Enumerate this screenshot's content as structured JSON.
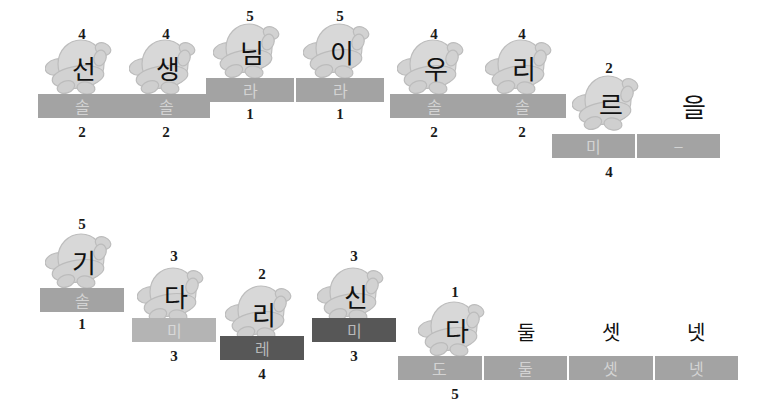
{
  "worksheet": {
    "title": "Korean music rhythm worksheet",
    "background_color": "#ffffff",
    "palette": {
      "bar_mid": "#a3a3a3",
      "bar_light": "#b4b4b4",
      "bar_dark": "#575757",
      "bar_text": "#d3d3d3",
      "number_text": "#1a1a1a",
      "syllable_text": "#111111",
      "mascot_fill": "#d6d6d6",
      "mascot_stroke": "#bdbdbd"
    }
  },
  "rows": [
    {
      "row_index": 1,
      "groups": [
        {
          "id": "g1",
          "top_number": "4",
          "syllable": "선",
          "has_mascot": true,
          "bottom_number": "2",
          "bar": {
            "shade": "mid",
            "segments": [
              "솔"
            ]
          },
          "x": 38,
          "mascot_y": 36,
          "bar_y": 94,
          "top_num_y": 26,
          "bottom_num_y": 124,
          "bar_w": 88
        },
        {
          "id": "g2",
          "top_number": "4",
          "syllable": "생",
          "has_mascot": true,
          "bottom_number": "2",
          "bar": {
            "shade": "mid",
            "segments": [
              "솔"
            ]
          },
          "x": 122,
          "mascot_y": 36,
          "bar_y": 94,
          "top_num_y": 26,
          "bottom_num_y": 124,
          "bar_w": 88
        },
        {
          "id": "g3",
          "top_number": "5",
          "syllable": "님",
          "has_mascot": true,
          "bottom_number": "1",
          "bar": {
            "shade": "mid",
            "segments": [
              "라"
            ]
          },
          "x": 206,
          "mascot_y": 20,
          "bar_y": 78,
          "top_num_y": 8,
          "bottom_num_y": 106,
          "bar_w": 88
        },
        {
          "id": "g4",
          "top_number": "5",
          "syllable": "이",
          "has_mascot": true,
          "bottom_number": "1",
          "bar": {
            "shade": "mid",
            "segments": [
              "라"
            ]
          },
          "x": 296,
          "mascot_y": 20,
          "bar_y": 78,
          "top_num_y": 8,
          "bottom_num_y": 106,
          "bar_w": 88
        },
        {
          "id": "g5",
          "top_number": "4",
          "syllable": "우",
          "has_mascot": true,
          "bottom_number": "2",
          "bar": {
            "shade": "mid",
            "segments": [
              "솔"
            ]
          },
          "x": 390,
          "mascot_y": 36,
          "bar_y": 94,
          "top_num_y": 26,
          "bottom_num_y": 124,
          "bar_w": 88
        },
        {
          "id": "g6",
          "top_number": "4",
          "syllable": "리",
          "has_mascot": true,
          "bottom_number": "2",
          "bar": {
            "shade": "mid",
            "segments": [
              "솔"
            ]
          },
          "x": 478,
          "mascot_y": 36,
          "bar_y": 94,
          "top_num_y": 26,
          "bottom_num_y": 124,
          "bar_w": 88
        },
        {
          "id": "g7",
          "top_number": "2",
          "syllable": "르",
          "second_syllable": "을",
          "has_mascot": true,
          "bottom_number": "4",
          "bar": {
            "shade": "mid",
            "segments": [
              "미",
              "–"
            ]
          },
          "x": 552,
          "mascot_y": 72,
          "bar_y": 134,
          "top_num_y": 60,
          "bottom_num_y": 164,
          "bar_w": 168
        }
      ]
    },
    {
      "row_index": 2,
      "groups": [
        {
          "id": "g8",
          "top_number": "5",
          "syllable": "기",
          "has_mascot": true,
          "bottom_number": "1",
          "bar": {
            "shade": "mid",
            "segments": [
              "솔"
            ]
          },
          "x": 40,
          "mascot_y": 230,
          "bar_y": 288,
          "top_num_y": 216,
          "bottom_num_y": 316,
          "bar_w": 84
        },
        {
          "id": "g9",
          "top_number": "3",
          "syllable": "다",
          "has_mascot": true,
          "bottom_number": "3",
          "bar": {
            "shade": "light",
            "segments": [
              "미"
            ]
          },
          "x": 132,
          "mascot_y": 264,
          "bar_y": 318,
          "top_num_y": 248,
          "bottom_num_y": 348,
          "bar_w": 84
        },
        {
          "id": "g10",
          "top_number": "2",
          "syllable": "리",
          "has_mascot": true,
          "bottom_number": "4",
          "bar": {
            "shade": "dark",
            "segments": [
              "레"
            ]
          },
          "x": 220,
          "mascot_y": 282,
          "bar_y": 336,
          "top_num_y": 266,
          "bottom_num_y": 366,
          "bar_w": 84
        },
        {
          "id": "g11",
          "top_number": "3",
          "syllable": "신",
          "has_mascot": true,
          "bottom_number": "3",
          "bar": {
            "shade": "dark",
            "segments": [
              "미"
            ]
          },
          "x": 312,
          "mascot_y": 264,
          "bar_y": 318,
          "top_num_y": 248,
          "bottom_num_y": 348,
          "bar_w": 84
        },
        {
          "id": "g12",
          "top_number": "1",
          "syllable": "다",
          "has_mascot": true,
          "extra_syllables": [
            "둘",
            "셋",
            "넷"
          ],
          "bottom_number": "5",
          "bar": {
            "shade": "mid",
            "segments": [
              "도",
              "둘",
              "셋",
              "넷"
            ]
          },
          "x": 398,
          "mascot_y": 298,
          "bar_y": 356,
          "top_num_y": 284,
          "bottom_num_y": 386,
          "bar_w": 340
        }
      ]
    }
  ]
}
